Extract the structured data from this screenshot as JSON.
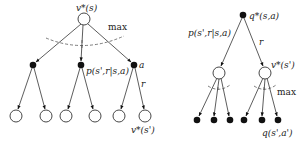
{
  "left_tree": {
    "title": "v*(s) backup diagram",
    "root_label": "v*(s)",
    "max_label": "max",
    "action_label": "a",
    "reward_label": "r",
    "transition_label": "p(s',r|s,a)",
    "leaf_label": "v*(s')",
    "root": {
      "x": 84,
      "y": 19,
      "type": "state"
    },
    "actions": [
      {
        "x": 33,
        "y": 65,
        "type": "action"
      },
      {
        "x": 81,
        "y": 65,
        "type": "action"
      },
      {
        "x": 134,
        "y": 65,
        "type": "action"
      }
    ],
    "leaves": [
      {
        "x": 16,
        "y": 116,
        "parent": 0
      },
      {
        "x": 46,
        "y": 116,
        "parent": 0
      },
      {
        "x": 66,
        "y": 116,
        "parent": 1
      },
      {
        "x": 95,
        "y": 116,
        "parent": 1
      },
      {
        "x": 119,
        "y": 116,
        "parent": 2
      },
      {
        "x": 145,
        "y": 116,
        "parent": 2
      }
    ]
  },
  "right_tree": {
    "title": "q*(s,a) backup diagram",
    "root_label": "q*(s,a)",
    "transition_label": "p(s',r|s,a)",
    "reward_label": "r",
    "state_label": "v*(s')",
    "max_label": "max",
    "leaf_label": "q(s',a')",
    "root": {
      "x": 243,
      "y": 15,
      "type": "action"
    },
    "states": [
      {
        "x": 219,
        "y": 73,
        "type": "state"
      },
      {
        "x": 265,
        "y": 73,
        "type": "state"
      }
    ],
    "leaves": [
      {
        "x": 197,
        "y": 120,
        "parent": 0
      },
      {
        "x": 214,
        "y": 120,
        "parent": 0
      },
      {
        "x": 230,
        "y": 120,
        "parent": 0
      },
      {
        "x": 244,
        "y": 120,
        "parent": 1
      },
      {
        "x": 262,
        "y": 120,
        "parent": 1
      },
      {
        "x": 278,
        "y": 120,
        "parent": 1
      }
    ]
  }
}
